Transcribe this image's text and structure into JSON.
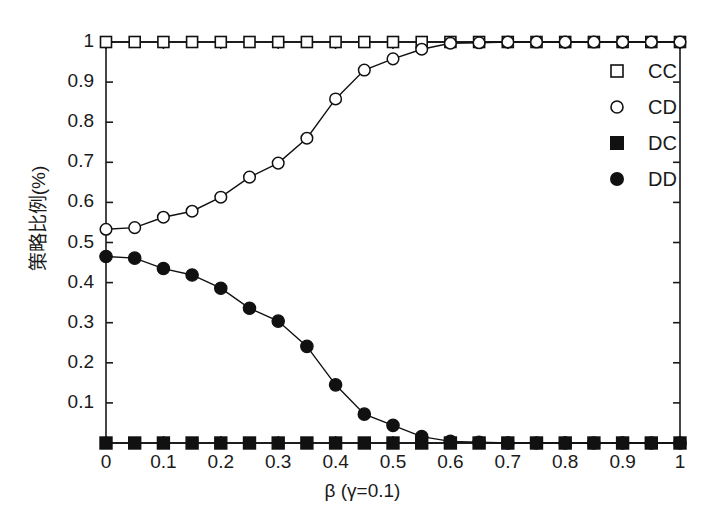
{
  "chart_data": {
    "type": "line",
    "title": "",
    "xlabel": "β (γ=0.1)",
    "ylabel": "策略比例(%)",
    "xlim": [
      0,
      1
    ],
    "ylim": [
      0,
      1
    ],
    "grid": false,
    "legend_position": "top-right",
    "xticks": [
      "0",
      "0.1",
      "0.2",
      "0.3",
      "0.4",
      "0.5",
      "0.6",
      "0.7",
      "0.8",
      "0.9",
      "1"
    ],
    "xtick_values": [
      0,
      0.1,
      0.2,
      0.3,
      0.4,
      0.5,
      0.6,
      0.7,
      0.8,
      0.9,
      1
    ],
    "yticks": [
      "0.1",
      "0.2",
      "0.3",
      "0.4",
      "0.5",
      "0.6",
      "0.7",
      "0.8",
      "0.9",
      "1"
    ],
    "ytick_values": [
      0.1,
      0.2,
      0.3,
      0.4,
      0.5,
      0.6,
      0.7,
      0.8,
      0.9,
      1
    ],
    "x": [
      0,
      0.05,
      0.1,
      0.15,
      0.2,
      0.25,
      0.3,
      0.35,
      0.4,
      0.45,
      0.5,
      0.55,
      0.6,
      0.65,
      0.7,
      0.75,
      0.8,
      0.85,
      0.9,
      0.95,
      1
    ],
    "series": [
      {
        "name": "CC",
        "marker": "open-square",
        "color": "#111111",
        "values": [
          1,
          1,
          1,
          1,
          1,
          1,
          1,
          1,
          1,
          1,
          1,
          1,
          1,
          1,
          1,
          1,
          1,
          1,
          1,
          1,
          1
        ]
      },
      {
        "name": "CD",
        "marker": "open-circle",
        "color": "#111111",
        "values": [
          0.533,
          0.537,
          0.563,
          0.578,
          0.613,
          0.663,
          0.698,
          0.76,
          0.858,
          0.93,
          0.958,
          0.982,
          0.997,
          0.998,
          1,
          1,
          1,
          1,
          1,
          1,
          1
        ]
      },
      {
        "name": "DC",
        "marker": "filled-square",
        "color": "#111111",
        "values": [
          0,
          0,
          0,
          0,
          0,
          0,
          0,
          0,
          0,
          0,
          0,
          0,
          0,
          0,
          0,
          0,
          0,
          0,
          0,
          0,
          0
        ]
      },
      {
        "name": "DD",
        "marker": "filled-circle",
        "color": "#111111",
        "values": [
          0.465,
          0.461,
          0.435,
          0.419,
          0.386,
          0.336,
          0.304,
          0.241,
          0.145,
          0.072,
          0.044,
          0.016,
          0.004,
          0.002,
          0,
          0,
          0,
          0,
          0,
          0,
          0
        ]
      }
    ]
  },
  "legend": {
    "items": [
      {
        "label": "CC",
        "marker": "open-square"
      },
      {
        "label": "CD",
        "marker": "open-circle"
      },
      {
        "label": "DC",
        "marker": "filled-square"
      },
      {
        "label": "DD",
        "marker": "filled-circle"
      }
    ]
  },
  "axes": {
    "x_label": "β (γ=0.1)",
    "y_label": "策略比例(%)"
  }
}
